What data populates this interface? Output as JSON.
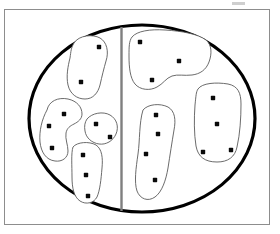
{
  "figure": {
    "title": "Partitioned region diagram with clustered points",
    "canvas": {
      "width": 280,
      "height": 234
    },
    "colors": {
      "background": "#ffffff",
      "frame_stroke": "#8d8d8d",
      "boundary_stroke": "#000000",
      "divider_stroke": "#7f7f7f",
      "blob_stroke": "#5a5a5a",
      "point_fill": "#0a0a0a"
    },
    "frame": {
      "x": 4,
      "y": 9,
      "width": 266,
      "height": 216
    },
    "boundary": {
      "shape": "ellipse",
      "cx": 142,
      "cy": 118.5,
      "rx": 113,
      "ry": 93.5
    },
    "divider": {
      "orientation": "vertical",
      "x": 121.5,
      "y1": 27,
      "y2": 211
    },
    "smudge": {
      "x": 232,
      "y": 2,
      "width": 13,
      "height": 3
    },
    "counts": {
      "total_points": 21,
      "total_clusters": 7,
      "left_half_clusters": 4,
      "right_half_clusters": 3,
      "left_half_points": 10,
      "right_half_points": 11
    }
  },
  "clusters": [
    {
      "id": "cluster-upper-left",
      "side": "left",
      "point_count": 2,
      "path": "M 74 43 C 79 35, 93 34, 100 38 C 107 42, 109 52, 106 61 C 104 68, 102 76, 100 85 C 98 93, 93 99, 85 99 C 77 99, 70 94, 68 85 C 66 76, 68 66, 70 58 C 71 51, 71 48, 74 43 Z",
      "points": [
        {
          "x": 99,
          "y": 47
        },
        {
          "x": 81,
          "y": 82
        }
      ]
    },
    {
      "id": "cluster-left-c-shape",
      "side": "left",
      "point_count": 3,
      "path": "M 47 110 C 49 101, 58 97, 68 99 C 77 101, 82 107, 82 114 C 82 119, 78 122, 74 124 C 70 126, 67 128, 66 133 C 65 139, 68 145, 68 151 C 68 158, 62 162, 55 161 C 46 160, 41 152, 40 142 C 39 131, 42 119, 47 110 Z",
      "points": [
        {
          "x": 64,
          "y": 114
        },
        {
          "x": 49,
          "y": 126
        },
        {
          "x": 52,
          "y": 148
        }
      ]
    },
    {
      "id": "cluster-left-small-oval",
      "side": "left",
      "point_count": 2,
      "path": "M 87 119 C 92 113, 103 111, 110 115 C 117 119, 119 127, 116 134 C 113 141, 106 145, 99 144 C 92 143, 86 138, 85 131 C 84 126, 85 122, 87 119 Z",
      "points": [
        {
          "x": 96,
          "y": 124
        },
        {
          "x": 110,
          "y": 137
        }
      ]
    },
    {
      "id": "cluster-lower-left",
      "side": "left",
      "point_count": 3,
      "path": "M 73 147 C 77 142, 89 141, 96 145 C 102 149, 103 158, 102 168 C 101 180, 100 190, 97 197 C 94 203, 86 205, 80 201 C 74 197, 72 188, 72 177 C 72 166, 71 153, 73 147 Z",
      "points": [
        {
          "x": 83,
          "y": 155
        },
        {
          "x": 86,
          "y": 175
        },
        {
          "x": 88,
          "y": 196
        }
      ]
    },
    {
      "id": "cluster-upper-right",
      "side": "right",
      "point_count": 3,
      "path": "M 132 37 C 137 31, 150 29, 165 30 C 182 31, 198 34, 206 40 C 212 45, 212 54, 209 62 C 206 70, 200 74, 192 75 C 184 76, 178 74, 172 76 C 166 78, 163 84, 157 87 C 150 91, 140 90, 135 84 C 130 78, 129 67, 129 56 C 129 47, 129 41, 132 37 Z",
      "points": [
        {
          "x": 140,
          "y": 42
        },
        {
          "x": 179,
          "y": 61
        },
        {
          "x": 152,
          "y": 80
        }
      ]
    },
    {
      "id": "cluster-center-right",
      "side": "right",
      "point_count": 4,
      "path": "M 143 110 C 148 104, 160 103, 168 107 C 175 111, 176 120, 174 130 C 172 142, 170 155, 168 168 C 166 180, 162 192, 155 197 C 148 202, 140 199, 137 191 C 134 182, 136 168, 138 154 C 140 140, 139 123, 143 110 Z",
      "points": [
        {
          "x": 156,
          "y": 115
        },
        {
          "x": 158,
          "y": 134
        },
        {
          "x": 146,
          "y": 154
        },
        {
          "x": 155,
          "y": 180
        }
      ]
    },
    {
      "id": "cluster-far-right",
      "side": "right",
      "point_count": 4,
      "path": "M 198 89 C 202 83, 216 82, 228 84 C 238 86, 241 93, 241 104 C 241 118, 240 134, 237 147 C 235 157, 228 162, 217 162 C 205 162, 198 157, 196 146 C 194 134, 194 118, 195 105 C 196 96, 196 92, 198 89 Z",
      "points": [
        {
          "x": 213,
          "y": 98
        },
        {
          "x": 217,
          "y": 124
        },
        {
          "x": 203,
          "y": 152
        },
        {
          "x": 231,
          "y": 150
        }
      ]
    }
  ],
  "point_style": {
    "radius": 2.2,
    "shape": "square-dot"
  }
}
